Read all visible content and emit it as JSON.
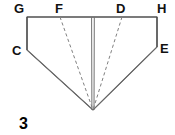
{
  "figure": {
    "number_label": "3",
    "caption": "",
    "stroke_color": "#555555",
    "dash_color": "#777777",
    "text_color": "#111111",
    "background": "#ffffff",
    "vertices": [
      {
        "id": "G",
        "label": "G",
        "x": 27,
        "y": 17,
        "kind": "corner"
      },
      {
        "id": "F",
        "label": "F",
        "x": 60,
        "y": 17,
        "kind": "fold-endpoint"
      },
      {
        "id": "D",
        "label": "D",
        "x": 122,
        "y": 17,
        "kind": "fold-endpoint"
      },
      {
        "id": "H",
        "label": "H",
        "x": 157,
        "y": 17,
        "kind": "corner"
      },
      {
        "id": "C",
        "label": "C",
        "x": 27,
        "y": 50,
        "kind": "corner"
      },
      {
        "id": "E",
        "label": "E",
        "x": 157,
        "y": 47,
        "kind": "corner"
      },
      {
        "id": "A",
        "label": "",
        "x": 93,
        "y": 110,
        "kind": "apex"
      }
    ],
    "solid_edges": [
      {
        "name": "top-edge",
        "from": "G",
        "to": "H"
      },
      {
        "name": "left-edge",
        "from": "G",
        "to": "C"
      },
      {
        "name": "right-edge",
        "from": "H",
        "to": "E"
      },
      {
        "name": "lower-left-edge",
        "from": "C",
        "to": "A"
      },
      {
        "name": "lower-right-edge",
        "from": "E",
        "to": "A"
      }
    ],
    "center_line": {
      "name": "center-fold-line",
      "from": "T",
      "to": "A",
      "x": 93,
      "y_top": 17,
      "y_bottom": 110,
      "style": "double-solid"
    },
    "dashed_edges": [
      {
        "name": "fold-line-F",
        "from": "F",
        "to": "A"
      },
      {
        "name": "fold-line-D",
        "from": "D",
        "to": "A"
      }
    ]
  }
}
